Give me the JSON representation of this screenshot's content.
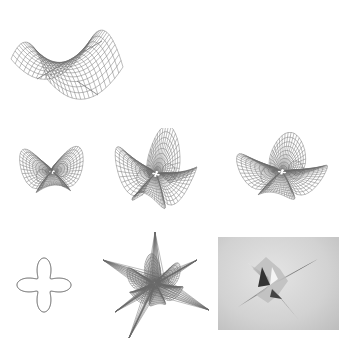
{
  "figure": {
    "panels": [
      {
        "id": "saddle",
        "kind": "wireframe-surface",
        "description": "saddle surface with axis lines"
      },
      {
        "id": "star-3",
        "kind": "wireframe-surface",
        "description": "three-lobed minimal surface"
      },
      {
        "id": "star-4-a",
        "kind": "wireframe-surface",
        "description": "four-lobed spiky minimal surface"
      },
      {
        "id": "star-4-b",
        "kind": "wireframe-surface",
        "description": "four-pointed star minimal surface"
      },
      {
        "id": "knot-curve",
        "kind": "boundary-curve",
        "description": "interlaced boundary curve"
      },
      {
        "id": "star-multi",
        "kind": "wireframe-surface",
        "description": "multi-petal wireframe surface"
      },
      {
        "id": "shaded-render",
        "kind": "shaded-surface",
        "description": "grayscale shaded render of star surface"
      }
    ],
    "colors": {
      "background": "#ffffff",
      "wire": "#6a6a6a",
      "render_bg": "#d2d2d2"
    }
  }
}
